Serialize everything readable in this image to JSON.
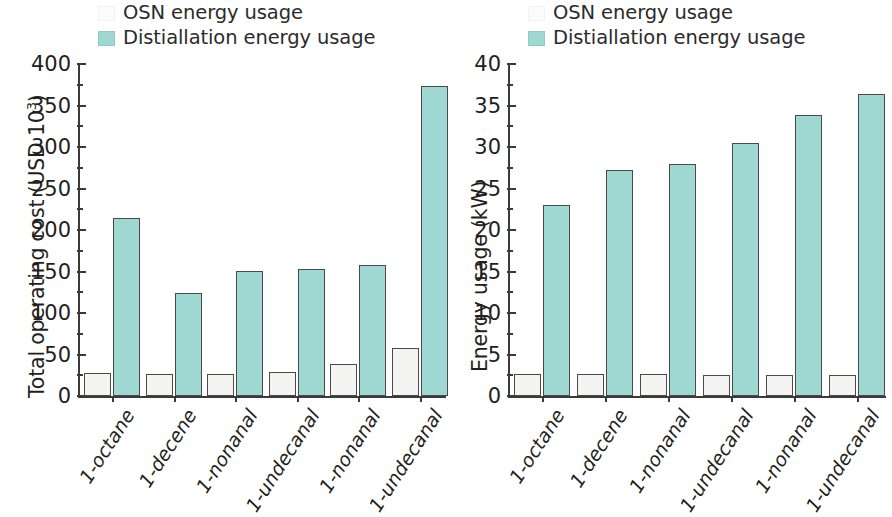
{
  "chart_data": [
    {
      "type": "bar",
      "panel": "left",
      "title": "",
      "xlabel": "",
      "ylabel": "Total operating cost (USD 10³)",
      "ylabel_main": "Total operating cost (USD 10",
      "ylabel_sup": "3",
      "ylabel_tail": ")",
      "ylim": [
        0,
        400
      ],
      "ytick_step": 50,
      "yticks": [
        "0",
        "50",
        "100",
        "150",
        "200",
        "250",
        "300",
        "350",
        "400"
      ],
      "grid": false,
      "legend_position": "top-center",
      "categories": [
        "1-octane",
        "1-decene",
        "1-nonanal",
        "1-undecanal",
        "1-nonanal",
        "1-undecanal"
      ],
      "series": [
        {
          "name": "OSN energy usage",
          "color": "#f4f4f2",
          "values": [
            28,
            27,
            27,
            29,
            39,
            58
          ]
        },
        {
          "name": "Distiallation energy usage",
          "color": "#9fd8d3",
          "values": [
            215,
            124,
            151,
            153,
            158,
            373
          ]
        }
      ]
    },
    {
      "type": "bar",
      "panel": "right",
      "title": "",
      "xlabel": "",
      "ylabel": "Energy usage (kW)",
      "ylabel_main": "Energy usage (kW)",
      "ylabel_sup": "",
      "ylabel_tail": "",
      "ylim": [
        0,
        40
      ],
      "ytick_step": 5,
      "yticks": [
        "0",
        "5",
        "10",
        "15",
        "20",
        "25",
        "30",
        "35",
        "40"
      ],
      "grid": false,
      "legend_position": "top-center",
      "categories": [
        "1-octane",
        "1-decene",
        "1-nonanal",
        "1-undecanal",
        "1-nonanal",
        "1-undecanal"
      ],
      "series": [
        {
          "name": "OSN energy usage",
          "color": "#f4f4f2",
          "values": [
            2.7,
            2.6,
            2.6,
            2.5,
            2.5,
            2.5
          ]
        },
        {
          "name": "Distiallation energy usage",
          "color": "#9fd8d3",
          "values": [
            23.0,
            27.2,
            28.0,
            30.5,
            33.8,
            36.4
          ]
        }
      ]
    }
  ],
  "legend": {
    "items": [
      {
        "label": "OSN energy usage",
        "swatch": "osn"
      },
      {
        "label": "Distiallation energy usage",
        "swatch": "dist"
      }
    ]
  },
  "colors": {
    "distillation": "#9fd8d3",
    "osn": "#f4f4f2",
    "axis": "#3a3a3a",
    "text": "#231f20"
  }
}
